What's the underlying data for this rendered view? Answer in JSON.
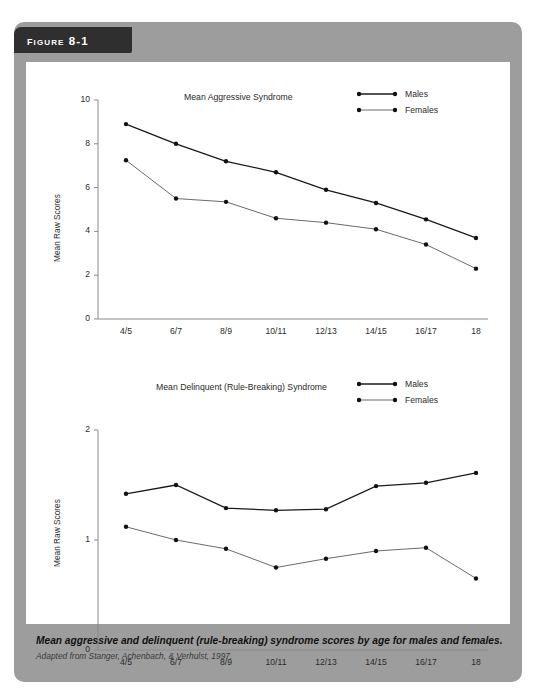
{
  "figure": {
    "banner_label": "Figure 8-1",
    "caption_main": "Mean aggressive and delinquent (rule-breaking) syndrome scores by age for males and females.",
    "caption_source": "Adapted from Stanger, Achenbach, & Verhulst, 1997."
  },
  "colors": {
    "panel": "#9d9d9d",
    "banner": "#2f2f2f",
    "plot_background": "#ffffff",
    "males_line": "#1a1a1a",
    "females_line": "#6a6a6a",
    "axis": "#8a8a8a",
    "text": "#2a2a2a"
  },
  "chart_data": [
    {
      "type": "line",
      "title": "Mean Aggressive Syndrome",
      "xlabel": "",
      "ylabel": "Mean Raw Scores",
      "categories": [
        "4/5",
        "6/7",
        "8/9",
        "10/11",
        "12/13",
        "14/15",
        "16/17",
        "18"
      ],
      "ylim": [
        0,
        10
      ],
      "yticks": [
        0,
        2,
        4,
        6,
        8,
        10
      ],
      "grid": false,
      "legend_position": "top-right",
      "series": [
        {
          "name": "Males",
          "values": [
            8.9,
            8.0,
            7.2,
            6.7,
            5.9,
            5.3,
            4.55,
            3.7
          ]
        },
        {
          "name": "Females",
          "values": [
            7.25,
            5.5,
            5.35,
            4.6,
            4.4,
            4.1,
            3.4,
            2.3
          ]
        }
      ]
    },
    {
      "type": "line",
      "title": "Mean Delinquent (Rule-Breaking) Syndrome",
      "xlabel": "",
      "ylabel": "Mean Raw Scores",
      "categories": [
        "4/5",
        "6/7",
        "8/9",
        "10/11",
        "12/13",
        "14/15",
        "16/17",
        "18"
      ],
      "ylim": [
        0,
        2
      ],
      "yticks": [
        0,
        1,
        2
      ],
      "grid": false,
      "legend_position": "top-right",
      "series": [
        {
          "name": "Males",
          "values": [
            1.42,
            1.5,
            1.29,
            1.27,
            1.28,
            1.49,
            1.52,
            1.61
          ]
        },
        {
          "name": "Females",
          "values": [
            1.12,
            1.0,
            0.92,
            0.75,
            0.83,
            0.9,
            0.93,
            0.65
          ]
        }
      ]
    }
  ]
}
